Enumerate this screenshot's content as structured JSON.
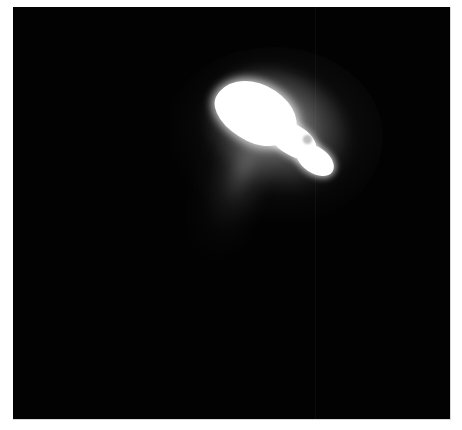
{
  "image": {
    "subject": "comet nucleus with dust jet",
    "background_color": "#020202",
    "frame_border_color": "#d8d8d8",
    "nucleus_color": "#ffffff"
  }
}
